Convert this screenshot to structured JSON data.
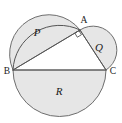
{
  "figure": {
    "background_color": "#ffffff",
    "fill_color": "#e6e6e6",
    "stroke_color": "#6e6e6e",
    "label_color": "#1a1a1a"
  },
  "vertices": [
    {
      "id": "A",
      "label": "A",
      "x": 80,
      "y": 30,
      "label_x": 84,
      "label_y": 21
    },
    {
      "id": "B",
      "label": "B",
      "x": 13,
      "y": 70,
      "label_x": 7,
      "label_y": 72
    },
    {
      "id": "C",
      "label": "C",
      "x": 106,
      "y": 70,
      "label_x": 113,
      "label_y": 72
    }
  ],
  "regions": [
    {
      "id": "P",
      "label": "P",
      "label_x": 37,
      "label_y": 33,
      "description": "semicircle on chord AB"
    },
    {
      "id": "Q",
      "label": "Q",
      "label_x": 99,
      "label_y": 48,
      "description": "semicircle on chord AC"
    },
    {
      "id": "R",
      "label": "R",
      "label_x": 59,
      "label_y": 92,
      "description": "lower half of the main circle"
    }
  ],
  "marks": [
    {
      "id": "right-angle-at-A",
      "vertex": "A",
      "symbol": "square",
      "angle_degrees": 90
    }
  ],
  "geometry": {
    "main_circle": {
      "cx": 59.5,
      "cy": 70,
      "r": 46.5
    },
    "semicircle_P": {
      "cx": 46.5,
      "cy": 50,
      "r": 39.3,
      "rotation_degrees": -31.2
    },
    "semicircle_Q": {
      "cx": 93,
      "cy": 50,
      "r": 23.4,
      "rotation_degrees": 56.9
    },
    "chord_BC": {
      "x1": 13,
      "y1": 70,
      "x2": 106,
      "y2": 70
    },
    "chord_AB": {
      "x1": 80,
      "y1": 30,
      "x2": 13,
      "y2": 70
    },
    "chord_AC": {
      "x1": 80,
      "y1": 30,
      "x2": 106,
      "y2": 70
    }
  }
}
